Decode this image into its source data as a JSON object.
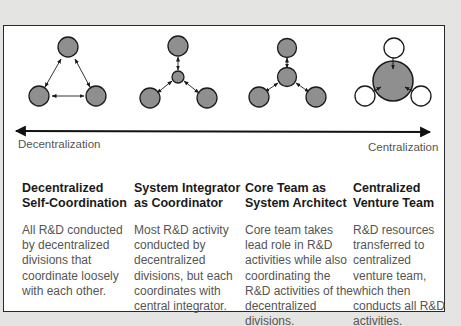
{
  "colors": {
    "node_fill": "#8f8f8f",
    "node_stroke": "#1a1a1a",
    "empty_node_fill": "#ffffff",
    "frame_border": "#2a2a2a",
    "background": "#e4e4e2",
    "title_text": "#1a1a1a",
    "body_text": "#555555"
  },
  "axis": {
    "left_label": "Decentralization",
    "right_label": "Centralization",
    "direction": "bidirectional"
  },
  "models": [
    {
      "title": "Decentralized Self-Coordination",
      "description": "All R&D conducted by decentralized divisions that coordinate loosely with each other.",
      "diagram": "three-peer-nodes-mutual-links"
    },
    {
      "title": "System Integrator as Coordinator",
      "description": "Most R&D activity conducted by decentralized divisions, but each coordinates with central integrator.",
      "diagram": "small-hub-with-three-spokes"
    },
    {
      "title": "Core Team as System Architect",
      "description": "Core team takes lead role in R&D activities while also coordinating the R&D activities of the decentralized divisions.",
      "diagram": "medium-hub-with-three-spokes"
    },
    {
      "title": "Centralized Venture Team",
      "description": "R&D resources transferred to centralized venture team, which then conducts all R&D activities.",
      "diagram": "large-hub-absorbing-empty-nodes"
    }
  ]
}
